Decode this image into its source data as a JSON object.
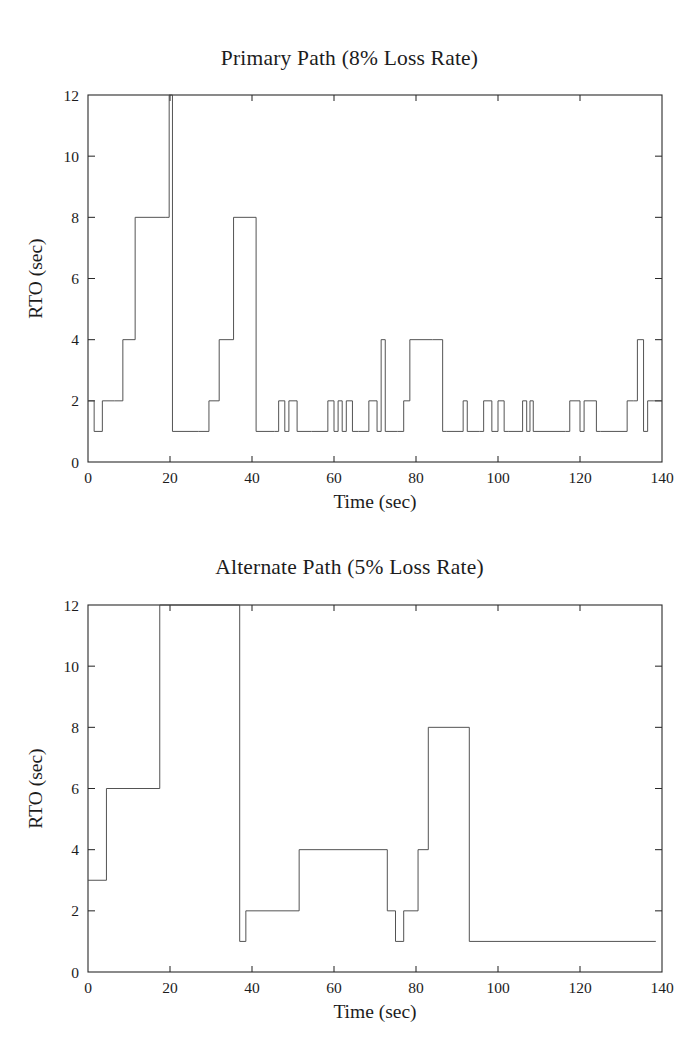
{
  "page": {
    "background": "#ffffff",
    "line_color": "#4a4a4a",
    "axis_color": "#2a2a2a",
    "text_color": "#1c1c1c"
  },
  "chart_data": [
    {
      "id": "primary",
      "type": "line",
      "step": "post",
      "title": "Primary Path (8% Loss Rate)",
      "xlabel": "Time (sec)",
      "ylabel": "RTO (sec)",
      "xlim": [
        0,
        140
      ],
      "ylim": [
        0,
        12
      ],
      "xticks": [
        0,
        20,
        40,
        60,
        80,
        100,
        120,
        140
      ],
      "xticklabels": [
        "0",
        "20",
        "40",
        "60",
        "80",
        "100",
        "120",
        "140"
      ],
      "yticks": [
        0,
        2,
        4,
        6,
        8,
        10,
        12
      ],
      "yticklabels": [
        "0",
        "2",
        "4",
        "6",
        "8",
        "10",
        "12"
      ],
      "grid": false,
      "legend": null,
      "x": [
        0,
        1.5,
        3.5,
        6.5,
        8.5,
        11.5,
        19.0,
        19.8,
        20.6,
        27.0,
        29.5,
        32.0,
        35.5,
        41.0,
        45.5,
        46.5,
        48.0,
        49.0,
        51.0,
        54.5,
        58.5,
        60.0,
        61.0,
        62.0,
        63.0,
        64.5,
        66.0,
        68.5,
        70.5,
        71.5,
        72.5,
        75.5,
        77.0,
        78.5,
        84.0,
        86.5,
        87.5,
        91.5,
        92.5,
        95.5,
        96.5,
        98.5,
        100.0,
        101.5,
        102.5,
        106.0,
        107.0,
        107.8,
        108.6,
        116.5,
        117.5,
        120.0,
        121.0,
        124.0,
        125.0,
        131.5,
        133.0,
        134.0,
        135.5,
        136.5,
        138.0,
        140
      ],
      "y": [
        2,
        1,
        2,
        2,
        4,
        8,
        8,
        12,
        1,
        1,
        2,
        4,
        8,
        1,
        1,
        2,
        1,
        2,
        1,
        1,
        2,
        1,
        2,
        1,
        2,
        1,
        1,
        2,
        1,
        4,
        1,
        1,
        2,
        4,
        4,
        1,
        1,
        2,
        1,
        1,
        2,
        1,
        2,
        1,
        1,
        2,
        1,
        2,
        1,
        1,
        2,
        1,
        2,
        1,
        1,
        2,
        2,
        4,
        1,
        2,
        2,
        2
      ]
    },
    {
      "id": "alternate",
      "type": "line",
      "step": "post",
      "title": "Alternate Path (5% Loss Rate)",
      "xlabel": "Time (sec)",
      "ylabel": "RTO (sec)",
      "xlim": [
        0,
        140
      ],
      "ylim": [
        0,
        12
      ],
      "xticks": [
        0,
        20,
        40,
        60,
        80,
        100,
        120,
        140
      ],
      "xticklabels": [
        "0",
        "20",
        "40",
        "60",
        "80",
        "100",
        "120",
        "140"
      ],
      "yticks": [
        0,
        2,
        4,
        6,
        8,
        10,
        12
      ],
      "yticklabels": [
        "0",
        "2",
        "4",
        "6",
        "8",
        "10",
        "12"
      ],
      "grid": false,
      "legend": null,
      "x": [
        0,
        4.5,
        17.5,
        37.0,
        38.5,
        51.5,
        73.0,
        75.0,
        77.0,
        80.5,
        83.0,
        93.0,
        138.5
      ],
      "y": [
        3,
        6,
        12,
        1,
        2,
        4,
        2,
        1,
        2,
        4,
        8,
        1,
        1
      ]
    }
  ]
}
